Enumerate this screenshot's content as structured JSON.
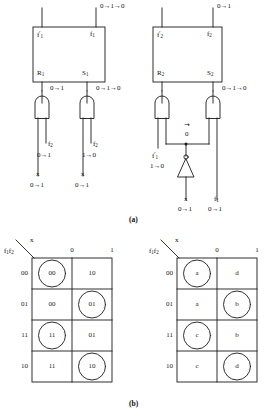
{
  "figure": {
    "caption_a": "(a)",
    "caption_b": "(b)"
  },
  "circuit": {
    "blocks": [
      {
        "id": "latch1",
        "top_left_label": "f′1",
        "top_right_label": "f1",
        "bottom_left_label": "R1",
        "bottom_right_label": "S1",
        "top_right_wire_value": "0→1→0"
      },
      {
        "id": "latch2",
        "top_left_label": "f′2",
        "top_right_label": "f2",
        "bottom_left_label": "R2",
        "bottom_right_label": "S2",
        "top_right_wire_value": "0→1"
      }
    ],
    "gate_output_values": [
      {
        "id": "r1-out",
        "value": "0→1"
      },
      {
        "id": "s1-out",
        "value": "0→1→0"
      },
      {
        "id": "s2-out",
        "value": "0→1→0"
      }
    ],
    "inverter": {
      "input_label": "x",
      "input_value": "0→1",
      "output_label": "f′1",
      "output_value": "1→0",
      "node_value": "0",
      "node_arrow": "→"
    },
    "inputs": [
      {
        "id": "g1-in-a",
        "label": "f2",
        "value": "0→1"
      },
      {
        "id": "g1-in-b",
        "label": "x",
        "value": "0→1"
      },
      {
        "id": "g2-in-a",
        "label": "f2",
        "value": "1→0"
      },
      {
        "id": "g2-in-b",
        "label": "x",
        "value": "0→1"
      },
      {
        "id": "g4-in-b",
        "label": "f1",
        "value": "0→1"
      }
    ]
  },
  "kmaps": [
    {
      "id": "kmap-left",
      "corner_top": "x",
      "corner_bottom": "f1f2",
      "col_headers": [
        "0",
        "1"
      ],
      "row_headers": [
        "00",
        "01",
        "11",
        "10"
      ],
      "cells": [
        [
          "00",
          "10"
        ],
        [
          "00",
          "01"
        ],
        [
          "11",
          "01"
        ],
        [
          "11",
          "10"
        ]
      ],
      "circled": [
        [
          true,
          false
        ],
        [
          false,
          true
        ],
        [
          true,
          false
        ],
        [
          false,
          true
        ]
      ]
    },
    {
      "id": "kmap-right",
      "corner_top": "x",
      "corner_bottom": "f1f2",
      "col_headers": [
        "0",
        "1"
      ],
      "row_headers": [
        "00",
        "01",
        "11",
        "10"
      ],
      "cells": [
        [
          "a",
          "d"
        ],
        [
          "a",
          "b"
        ],
        [
          "c",
          "b"
        ],
        [
          "c",
          "d"
        ]
      ],
      "circled": [
        [
          true,
          false
        ],
        [
          false,
          true
        ],
        [
          true,
          false
        ],
        [
          false,
          true
        ]
      ]
    }
  ],
  "colors": {
    "ink": "#1a1a1a",
    "paper": "#ffffff"
  }
}
